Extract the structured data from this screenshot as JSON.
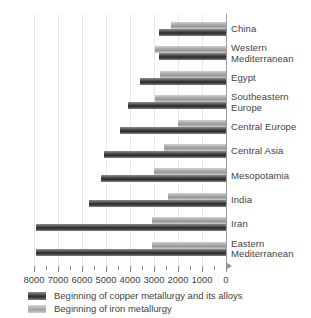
{
  "chart_data": {
    "type": "bar",
    "orientation": "horizontal",
    "title": "",
    "subtitle": "",
    "xlabel": "",
    "ylabel": "",
    "xlim": [
      8000,
      0
    ],
    "x_axis_reversed": true,
    "grid": true,
    "grid_axis": "x",
    "legend_position": "bottom-left",
    "tick_interval_major": 1000,
    "tick_interval_minor": 500,
    "tick_labels": [
      "8000",
      "7000",
      "6000",
      "5000",
      "4000",
      "3000",
      "2000",
      "1000",
      "0"
    ],
    "tick_values": [
      8000,
      7000,
      6000,
      5000,
      4000,
      3000,
      2000,
      1000,
      0
    ],
    "categories": [
      "China",
      "Western Mediterranean",
      "Egypt",
      "Southeastern Europe",
      "Central Europe",
      "Central Asia",
      "Mesopotamia",
      "India",
      "Iran",
      "Eastern Mediterranean"
    ],
    "category_lines": [
      [
        "China"
      ],
      [
        "Western",
        "Mediterranean"
      ],
      [
        "Egypt"
      ],
      [
        "Southeastern",
        "Europe"
      ],
      [
        "Central Europe"
      ],
      [
        "Central Asia"
      ],
      [
        "Mesopotamia"
      ],
      [
        "India"
      ],
      [
        "Iran"
      ],
      [
        "Eastern",
        "Mediterranean"
      ]
    ],
    "series": [
      {
        "name": "Beginning of copper metallurgy and its alloys",
        "color": "#2a2a2a",
        "values": [
          2800,
          2800,
          3600,
          4100,
          4400,
          5100,
          5200,
          5700,
          7900,
          7900
        ]
      },
      {
        "name": "Beginning of iron metallurgy",
        "color": "#a8a8a8",
        "values": [
          2300,
          2950,
          2750,
          2950,
          2000,
          2600,
          3000,
          2400,
          3100,
          3100
        ]
      }
    ]
  },
  "legend": {
    "items": [
      {
        "label": "Beginning of copper metallurgy and its alloys",
        "swatch": "copper"
      },
      {
        "label": "Beginning of iron metallurgy",
        "swatch": "iron"
      }
    ]
  },
  "axis": {
    "zero_label": "0",
    "max_label": "8000"
  }
}
